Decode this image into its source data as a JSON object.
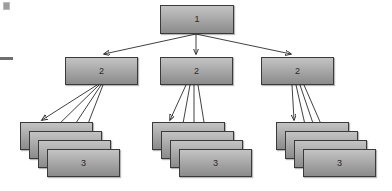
{
  "diagram": {
    "type": "hierarchy-tree",
    "title": "",
    "background_color": "#ffffff",
    "node_fill_top": "#c3c3c3",
    "node_fill_bottom": "#8b8b8b",
    "node_border_color": "#3a3a3a",
    "edge_color": "#2b2b2b",
    "levels": [
      {
        "level": 1,
        "label": "1",
        "count": 1,
        "nodes": [
          {
            "label": "1",
            "x": 160,
            "y": 5,
            "w": 74,
            "h": 29,
            "stacked": false
          }
        ]
      },
      {
        "level": 2,
        "label": "2",
        "count": 3,
        "nodes": [
          {
            "label": "2",
            "x": 65,
            "y": 57,
            "w": 73,
            "h": 28,
            "stacked": false
          },
          {
            "label": "2",
            "x": 160,
            "y": 57,
            "w": 73,
            "h": 28,
            "stacked": false
          },
          {
            "label": "2",
            "x": 261,
            "y": 57,
            "w": 73,
            "h": 28,
            "stacked": false
          }
        ]
      },
      {
        "level": 3,
        "label": "3",
        "count": 3,
        "stack_depth": 4,
        "nodes": [
          {
            "label": "3",
            "x": 20,
            "y": 122,
            "w": 73,
            "h": 28,
            "stacked": true,
            "depth": 4,
            "dx": 9,
            "dy": 9
          },
          {
            "label": "3",
            "x": 152,
            "y": 122,
            "w": 73,
            "h": 28,
            "stacked": true,
            "depth": 4,
            "dx": 9,
            "dy": 9
          },
          {
            "label": "3",
            "x": 276,
            "y": 122,
            "w": 73,
            "h": 28,
            "stacked": true,
            "depth": 4,
            "dx": 9,
            "dy": 9
          }
        ]
      }
    ],
    "edges": [
      {
        "from": "level1-node1",
        "to": "level2-node1"
      },
      {
        "from": "level1-node1",
        "to": "level2-node2"
      },
      {
        "from": "level1-node1",
        "to": "level2-node3"
      },
      {
        "from": "level2-node1",
        "to": "level3-stack1-layer1"
      },
      {
        "from": "level2-node1",
        "to": "level3-stack1-layer2"
      },
      {
        "from": "level2-node1",
        "to": "level3-stack1-layer3"
      },
      {
        "from": "level2-node1",
        "to": "level3-stack1-layer4"
      },
      {
        "from": "level2-node2",
        "to": "level3-stack2-layer1"
      },
      {
        "from": "level2-node2",
        "to": "level3-stack2-layer2"
      },
      {
        "from": "level2-node2",
        "to": "level3-stack2-layer3"
      },
      {
        "from": "level2-node2",
        "to": "level3-stack2-layer4"
      },
      {
        "from": "level2-node3",
        "to": "level3-stack3-layer1"
      },
      {
        "from": "level2-node3",
        "to": "level3-stack3-layer2"
      },
      {
        "from": "level2-node3",
        "to": "level3-stack3-layer3"
      },
      {
        "from": "level2-node3",
        "to": "level3-stack3-layer4"
      }
    ],
    "artifacts": [
      {
        "name": "margin-square",
        "x": 3,
        "y": 2,
        "w": 7,
        "h": 8
      },
      {
        "name": "margin-dash",
        "x": 0,
        "y": 57,
        "w": 13,
        "h": 3
      }
    ]
  }
}
